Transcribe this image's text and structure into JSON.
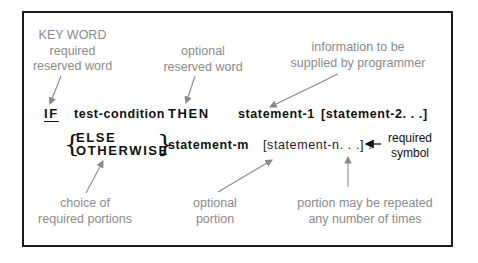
{
  "annotations": {
    "keyword": [
      "KEY WORD",
      "required",
      "reserved word"
    ],
    "optional_reserved": [
      "optional",
      "reserved word"
    ],
    "programmer_info": [
      "information to be",
      "supplied by programmer"
    ],
    "choice": [
      "choice of",
      "required portions"
    ],
    "optional_portion": [
      "optional",
      "portion"
    ],
    "repeated": [
      "portion may be repeated",
      "any number of times"
    ],
    "required_symbol": [
      "required",
      "symbol"
    ]
  },
  "syntax": {
    "line1": {
      "if": "IF",
      "test_condition": "test-condition",
      "then": "THEN",
      "statement1": "statement-1",
      "statement2": "[statement-2. . .]"
    },
    "line2": {
      "else": "ELSE",
      "otherwise": "OTHERWISE",
      "statement_m": "statement-m",
      "statement_n": "[statement-n. . .] ."
    }
  },
  "colors": {
    "annotation": "#8a8a8a",
    "code": "#111111",
    "frame": "#1a1a1a"
  }
}
